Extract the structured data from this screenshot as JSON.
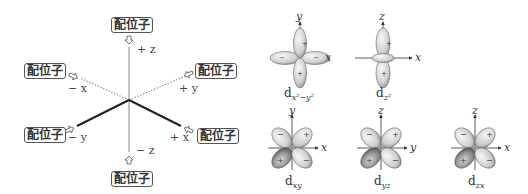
{
  "left_diagram": {
    "ligand_label": "配位子",
    "ligands": [
      {
        "position": "top",
        "label": "配位子"
      },
      {
        "position": "minus-x",
        "label": "配位子"
      },
      {
        "position": "plus-y",
        "label": "配位子"
      },
      {
        "position": "minus-y",
        "label": "配位子"
      },
      {
        "position": "plus-x",
        "label": "配位子"
      },
      {
        "position": "bottom",
        "label": "配位子"
      }
    ],
    "axes": {
      "plus_z": "+ z",
      "minus_z": "− z",
      "plus_x": "+ x",
      "minus_x": "− x",
      "plus_y": "+ y",
      "minus_y": "− y"
    }
  },
  "orbitals": [
    {
      "name": "d",
      "sub": "x²−y²",
      "axis_v": "y",
      "axis_h": "x"
    },
    {
      "name": "d",
      "sub": "z²",
      "axis_v": "z",
      "axis_h": "x"
    },
    {
      "name": "d",
      "sub": "xy",
      "axis_v": "y",
      "axis_h": "x",
      "signs": [
        "−",
        "+",
        "+",
        "−"
      ]
    },
    {
      "name": "d",
      "sub": "yz",
      "axis_v": "z",
      "axis_h": "y",
      "signs": [
        "−",
        "+",
        "+",
        "−"
      ]
    },
    {
      "name": "d",
      "sub": "zx",
      "axis_v": "z",
      "axis_h": "x",
      "signs": [
        "−",
        "+",
        "+",
        "−"
      ]
    }
  ],
  "colors": {
    "line_dark": "#222222",
    "line_light": "#999999",
    "lobe_light": "#e6e6e6",
    "lobe_dark": "#9a9a9a"
  }
}
